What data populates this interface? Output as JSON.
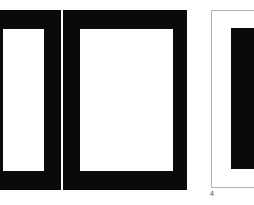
{
  "figure": {
    "caption": "4",
    "background_color": "#ffffff",
    "ink_color": "#0a0a0a",
    "hairline_color": "#b3b3b3",
    "panels": [
      {
        "name": "left-frame",
        "description": "heavy black rectangular frame, cropped at left edge",
        "fill": "#0a0a0a",
        "aperture_fill": "#ffffff"
      },
      {
        "name": "center-frame",
        "description": "heavy black rectangular frame with white aperture",
        "fill": "#0a0a0a",
        "aperture_fill": "#ffffff"
      },
      {
        "name": "side-panel",
        "description": "thin gray bordered panel containing a black block, cropped at right edge",
        "fill": "#ffffff",
        "border": "#b3b3b3",
        "block_fill": "#0a0a0a"
      }
    ]
  }
}
